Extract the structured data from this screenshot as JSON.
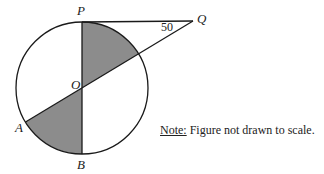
{
  "figure": {
    "points": {
      "P": {
        "label": "P",
        "x": 82,
        "y": 21
      },
      "Q": {
        "label": "Q",
        "x": 193,
        "y": 21
      },
      "O": {
        "label": "O",
        "x": 82,
        "y": 88
      },
      "A": {
        "label": "A",
        "x": 26,
        "y": 122
      },
      "B": {
        "label": "B",
        "x": 82,
        "y": 154
      }
    },
    "circle": {
      "cx": 82,
      "cy": 88,
      "r": 66
    },
    "angle_label": "50",
    "shaded_color": "#8c8c8c",
    "line_color": "#1a1a1a"
  },
  "note": {
    "head": "Note:",
    "text": " Figure not drawn to scale."
  }
}
